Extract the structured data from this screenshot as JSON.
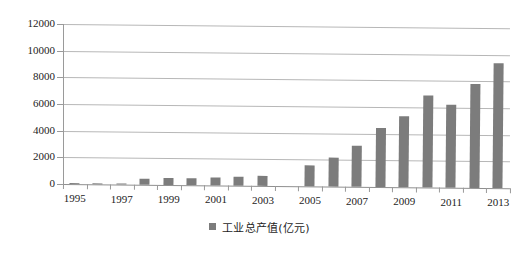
{
  "chart_data": {
    "type": "bar",
    "title": "",
    "subtitle": "",
    "xlabel": "",
    "ylabel": "",
    "ylim": [
      0,
      12000
    ],
    "grid": true,
    "legend_position": "bottom",
    "bar_color": "#7c7c7c",
    "categories": [
      "1995",
      "1996",
      "1997",
      "1998",
      "1999",
      "2000",
      "2001",
      "2002",
      "2003",
      "2004",
      "2005",
      "2006",
      "2007",
      "2008",
      "2009",
      "2010",
      "2011",
      "2012",
      "2013"
    ],
    "x_tick_labels": [
      "1995",
      "1997",
      "1999",
      "2001",
      "2003",
      "2005",
      "2007",
      "2009",
      "2011",
      "2013"
    ],
    "y_tick_labels": [
      "0",
      "2000",
      "4000",
      "6000",
      "8000",
      "10000",
      "12000"
    ],
    "y_ticks": [
      0,
      2000,
      4000,
      6000,
      8000,
      10000,
      12000
    ],
    "series": [
      {
        "name": "工业总产值(亿元)",
        "values": [
          60,
          80,
          90,
          480,
          520,
          560,
          600,
          640,
          760,
          0,
          1550,
          2150,
          3050,
          4400,
          5350,
          6900,
          6250,
          7800,
          9400
        ]
      }
    ],
    "legend": [
      "工业总产值(亿元)"
    ]
  },
  "legend": {
    "swatch_name": "legend-color-swatch",
    "label": "工业总产值(亿元)"
  }
}
